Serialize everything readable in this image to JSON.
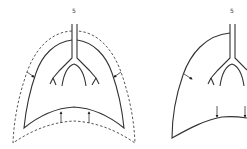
{
  "diagram": {
    "title": "",
    "panels": [
      {
        "id": "left",
        "label": "5",
        "description": "Lung with dashed outer outline; arrows on the sides point inward and arrows at the base point upward",
        "outline_style": "solid inner with dashed outer",
        "arrows": [
          "side-left-inward",
          "side-right-inward",
          "base-up",
          "base-up"
        ]
      },
      {
        "id": "right",
        "label": "5",
        "description": "Lung outline (partially cropped at right edge); arrow on side points inward and arrows at base point downward",
        "outline_style": "solid",
        "arrows": [
          "side-left-inward",
          "base-down",
          "base-down"
        ]
      }
    ],
    "colors": {
      "stroke": "#333333",
      "background": "#ffffff"
    }
  }
}
